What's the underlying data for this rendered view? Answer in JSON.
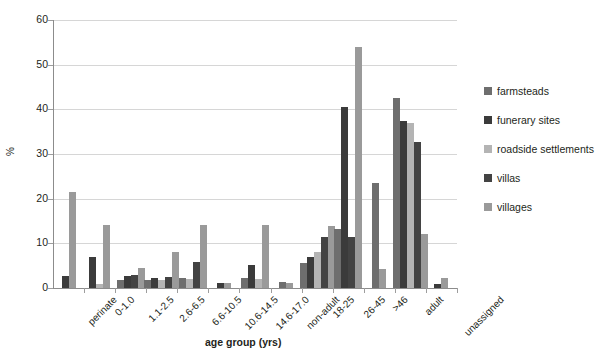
{
  "chart_data": {
    "type": "bar",
    "title": "",
    "xlabel": "age group (yrs)",
    "ylabel": "%",
    "ylim": [
      0,
      60
    ],
    "yticks": [
      0,
      10,
      20,
      30,
      40,
      50,
      60
    ],
    "grid": true,
    "legend_position": "right",
    "categories": [
      "perinate",
      "0-1.0",
      "1.1-2.5",
      "2.6-6.5",
      "6.6-10.5",
      "10.6-14.5",
      "14.6-17.0",
      "non-adult",
      "18-25",
      "26-45",
      ">46",
      "adult",
      "unassigned"
    ],
    "series": [
      {
        "name": "farmsteads",
        "color": "#6e6e6e",
        "values": [
          null,
          null,
          1.9,
          1.7,
          2.2,
          null,
          2.2,
          1.4,
          5.5,
          13.3,
          23.5,
          42.5,
          null
        ]
      },
      {
        "name": "funerary sites",
        "color": "#3b3b3b",
        "values": [
          2.8,
          7.0,
          2.6,
          2.2,
          null,
          1.2,
          5.1,
          null,
          7.0,
          40.5,
          null,
          37.3,
          1.0
        ]
      },
      {
        "name": "roadside settlements",
        "color": "#b4b4b4",
        "values": [
          null,
          0.9,
          null,
          1.8,
          2.0,
          null,
          2.0,
          null,
          8.0,
          null,
          null,
          37.0,
          null
        ]
      },
      {
        "name": "villas",
        "color": "#434343",
        "values": [
          null,
          null,
          2.9,
          2.5,
          5.8,
          null,
          null,
          null,
          11.5,
          11.5,
          null,
          32.7,
          null
        ]
      },
      {
        "name": "villages",
        "color": "#9a9a9a",
        "values": [
          21.4,
          14.2,
          4.4,
          8.1,
          14.2,
          1.1,
          14.1,
          1.1,
          13.8,
          54.0,
          4.3,
          12.2,
          2.3
        ]
      }
    ]
  },
  "legend": {
    "items": [
      {
        "label": "farmsteads",
        "swatch": "legend-swatch-farmsteads",
        "color": "#6e6e6e"
      },
      {
        "label": "funerary sites",
        "swatch": "legend-swatch-funerary-sites",
        "color": "#3b3b3b"
      },
      {
        "label": "roadside settlements",
        "swatch": "legend-swatch-roadside-settlements",
        "color": "#b4b4b4"
      },
      {
        "label": "villas",
        "swatch": "legend-swatch-villas",
        "color": "#434343"
      },
      {
        "label": "villages",
        "swatch": "legend-swatch-villages",
        "color": "#9a9a9a"
      }
    ]
  },
  "axes": {
    "y_title": "%",
    "x_title": "age group (yrs)",
    "y_tick_labels": [
      "60",
      "50",
      "40",
      "30",
      "20",
      "10",
      "0"
    ]
  }
}
